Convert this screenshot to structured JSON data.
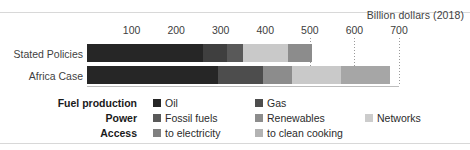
{
  "axis_title": "Billion dollars (2018)",
  "chart_data": {
    "type": "bar",
    "orientation": "horizontal",
    "stacked": true,
    "title": "",
    "subtitle": "",
    "xlabel": "Billion dollars (2018)",
    "ylabel": "",
    "xlim": [
      0,
      700
    ],
    "xticks": [
      100,
      200,
      300,
      400,
      500,
      600,
      700
    ],
    "xticklabels": [
      "100",
      "200",
      "300",
      "400",
      "500",
      "600",
      "700"
    ],
    "grid": "vertical-dotted-at-500-600-700",
    "legend_position": "bottom",
    "categories": [
      "Stated Policies",
      "Africa Case"
    ],
    "series": [
      {
        "name": "Oil",
        "group": "Fuel production",
        "color": "#262626",
        "values": [
          260,
          295
        ]
      },
      {
        "name": "Gas",
        "group": "Fuel production",
        "color": "#3f3f3f",
        "values": [
          55,
          0
        ]
      },
      {
        "name": "Fossil fuels",
        "group": "Power",
        "color": "#595959",
        "values": [
          35,
          100
        ]
      },
      {
        "name": "Renewables",
        "group": "Power",
        "color": "#808080",
        "values": [
          0,
          65
        ]
      },
      {
        "name": "Networks",
        "group": "Power",
        "color": "#c9c9c9",
        "values": [
          100,
          110
        ]
      },
      {
        "name": "to electricity",
        "group": "Access",
        "color": "#8c8c8c",
        "values": [
          55,
          85
        ]
      },
      {
        "name": "to clean cooking",
        "group": "Access",
        "color": "#b3b3b3",
        "values": [
          0,
          25
        ]
      }
    ],
    "totals": [
      505,
      680
    ],
    "annotations": []
  },
  "bars": [
    {
      "label": "Stated Policies",
      "segments": [
        {
          "name": "Oil",
          "value": 260,
          "color": "#262626"
        },
        {
          "name": "Gas",
          "value": 55,
          "color": "#3f3f3f"
        },
        {
          "name": "Fossil fuels",
          "value": 35,
          "color": "#595959"
        },
        {
          "name": "Networks",
          "value": 100,
          "color": "#c9c9c9"
        },
        {
          "name": "to electricity",
          "value": 55,
          "color": "#8c8c8c"
        }
      ]
    },
    {
      "label": "Africa Case",
      "segments": [
        {
          "name": "Oil",
          "value": 295,
          "color": "#262626"
        },
        {
          "name": "Fossil fuels",
          "value": 100,
          "color": "#4d4d4d"
        },
        {
          "name": "Renewables",
          "value": 65,
          "color": "#8c8c8c"
        },
        {
          "name": "Networks",
          "value": 110,
          "color": "#c9c9c9"
        },
        {
          "name": "to clean cooking",
          "value": 110,
          "color": "#a6a6a6"
        }
      ]
    }
  ],
  "legend": {
    "rows": [
      {
        "category": "Fuel production",
        "items": [
          {
            "label": "Oil",
            "color": "#262626"
          },
          {
            "label": "Gas",
            "color": "#4d4d4d"
          }
        ]
      },
      {
        "category": "Power",
        "items": [
          {
            "label": "Fossil fuels",
            "color": "#595959"
          },
          {
            "label": "Renewables",
            "color": "#8c8c8c"
          },
          {
            "label": "Networks",
            "color": "#cccccc"
          }
        ]
      },
      {
        "category": "Access",
        "items": [
          {
            "label": "to electricity",
            "color": "#808080"
          },
          {
            "label": "to clean cooking",
            "color": "#b3b3b3"
          }
        ]
      }
    ]
  }
}
